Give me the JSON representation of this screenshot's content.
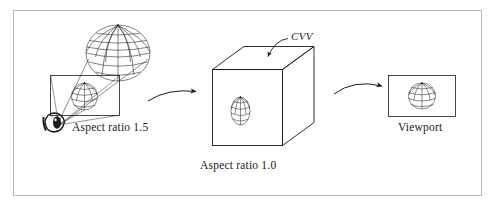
{
  "diagram": {
    "background_color": "#ffffff",
    "stroke_color": "#1b1b1b",
    "frame_color": "#b9b9b9",
    "labels": {
      "aspect_ratio_window": "Aspect ratio 1.5",
      "aspect_ratio_cvv": "Aspect ratio 1.0",
      "viewport": "Viewport",
      "cvv": "CVV"
    },
    "stages": [
      {
        "id": "world-window",
        "name": "world-window",
        "caption": "Aspect ratio 1.5",
        "shape": "rectangle",
        "contents": "wireframe-globe",
        "aspect_ratio": 1.5
      },
      {
        "id": "cvv-cube",
        "name": "canonical-view-volume",
        "caption": "Aspect ratio 1.0",
        "callout": "CVV",
        "shape": "cube",
        "contents": "wireframe-ellipsoid",
        "aspect_ratio": 1.0
      },
      {
        "id": "viewport",
        "name": "viewport",
        "caption": "Viewport",
        "shape": "rectangle",
        "contents": "wireframe-globe"
      }
    ],
    "icons": {
      "eye": "eye-icon",
      "globe_large": "wireframe-globe-icon",
      "globe_window": "wireframe-globe-icon",
      "globe_cube": "wireframe-ellipsoid-icon",
      "globe_viewport": "wireframe-globe-icon",
      "arrow_1": "curved-arrow-right-icon",
      "arrow_2": "curved-arrow-right-icon",
      "arrow_cvv": "curved-callout-arrow-icon"
    }
  }
}
